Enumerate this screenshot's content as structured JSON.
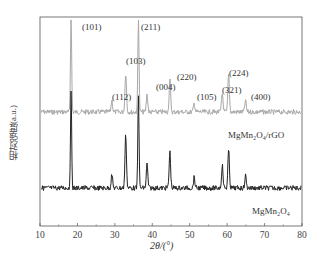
{
  "chart_data": {
    "type": "line",
    "title": "",
    "xlabel": "2θ/(°)",
    "ylabel": "相对强度(a.u.)",
    "xlim": [
      10,
      80
    ],
    "xticks": [
      10,
      20,
      30,
      40,
      50,
      60,
      70,
      80
    ],
    "grid": false,
    "legend": "inline labels",
    "series": [
      {
        "name": "MgMn2O4/rGO",
        "label_html": "MgMn₂O₄/rGO",
        "color": "#a8a8a8",
        "baseline_y": 112,
        "peaks": [
          {
            "x": 18.3,
            "hkl": "(101)",
            "height": 100
          },
          {
            "x": 29.2,
            "hkl": "(112)",
            "height": 12
          },
          {
            "x": 32.9,
            "hkl": "(103)",
            "height": 42
          },
          {
            "x": 36.3,
            "hkl": "(211)",
            "height": 100
          },
          {
            "x": 38.6,
            "hkl": "(004)",
            "height": 18
          },
          {
            "x": 44.7,
            "hkl": "(220)",
            "height": 33
          },
          {
            "x": 51.2,
            "hkl": "(105)",
            "height": 9
          },
          {
            "x": 58.7,
            "hkl": "(321)",
            "height": 20
          },
          {
            "x": 60.4,
            "hkl": "(224)",
            "height": 40
          },
          {
            "x": 64.9,
            "hkl": "(400)",
            "height": 12
          }
        ]
      },
      {
        "name": "MgMn2O4",
        "label_html": "MgMn₂O₄",
        "color": "#222222",
        "baseline_y": 188,
        "peaks": [
          {
            "x": 18.3,
            "hkl": "(101)",
            "height": 100
          },
          {
            "x": 29.2,
            "hkl": "(112)",
            "height": 14
          },
          {
            "x": 32.9,
            "hkl": "(103)",
            "height": 56
          },
          {
            "x": 36.3,
            "hkl": "(211)",
            "height": 100
          },
          {
            "x": 38.6,
            "hkl": "(004)",
            "height": 25
          },
          {
            "x": 44.7,
            "hkl": "(220)",
            "height": 38
          },
          {
            "x": 51.2,
            "hkl": "(105)",
            "height": 11
          },
          {
            "x": 58.7,
            "hkl": "(321)",
            "height": 24
          },
          {
            "x": 60.4,
            "hkl": "(224)",
            "height": 40
          },
          {
            "x": 64.9,
            "hkl": "(400)",
            "height": 13
          }
        ]
      }
    ],
    "annotations": [
      "(101)",
      "(112)",
      "(103)",
      "(211)",
      "(004)",
      "(220)",
      "(105)",
      "(321)",
      "(224)",
      "(400)"
    ]
  },
  "labels": {
    "ylabel": "相对强度(a.u.)",
    "xlabel": "2θ/(°)",
    "series_rgo": "MgMn₂O₄/rGO",
    "series_pure": "MgMn₂O₄"
  }
}
